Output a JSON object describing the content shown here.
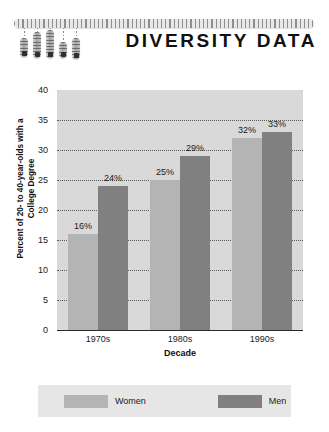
{
  "header": {
    "title": "DIVERSITY DATA",
    "graphic": {
      "name": "hanging-bars-graphic",
      "rail": "horizontal-rail",
      "bars": [
        {
          "height": 19,
          "line": 10
        },
        {
          "height": 26,
          "line": 4
        },
        {
          "height": 28,
          "line": 2
        },
        {
          "height": 16,
          "line": 14
        },
        {
          "height": 21,
          "line": 10
        }
      ]
    }
  },
  "chart_data": {
    "type": "bar",
    "title": "DIVERSITY DATA",
    "xlabel": "Decade",
    "ylabel": "Percent of 20- to 40-year-olds with a College Degree",
    "categories": [
      "1970s",
      "1980s",
      "1990s"
    ],
    "series": [
      {
        "name": "Women",
        "color": "#b4b4b4",
        "values": [
          16,
          25,
          32
        ],
        "labels": [
          "16%",
          "25%",
          "32%"
        ]
      },
      {
        "name": "Men",
        "color": "#808080",
        "values": [
          24,
          29,
          33
        ],
        "labels": [
          "24%",
          "29%",
          "33%"
        ]
      }
    ],
    "ylim": [
      0,
      40
    ],
    "yticks": [
      0,
      5,
      10,
      15,
      20,
      25,
      30,
      35,
      40
    ],
    "ytick_labels": [
      "0",
      "5",
      "10",
      "15",
      "20",
      "25",
      "30",
      "35",
      "40"
    ],
    "grid": true,
    "grid_style": "dotted",
    "legend_position": "bottom",
    "plot_background": "#d9d9d9",
    "page_background": "#ffffff"
  },
  "ylabel_lines": {
    "line1": "Percent of 20- to 40-year-olds with a",
    "line2": "College Degree"
  },
  "legend": {
    "women_label": "Women",
    "men_label": "Men"
  }
}
